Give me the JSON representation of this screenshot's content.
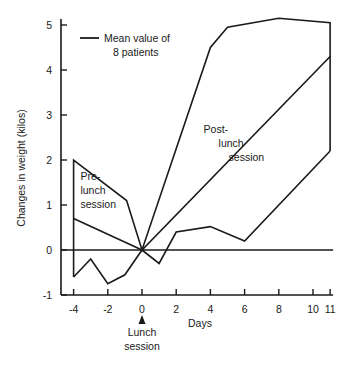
{
  "chart_data": {
    "type": "line",
    "title": "",
    "xlabel": "Days",
    "ylabel": "Changes in weight (kilos)",
    "xlim": [
      -4,
      11
    ],
    "ylim": [
      -1,
      5
    ],
    "x_ticks": [
      -4,
      -2,
      0,
      2,
      4,
      6,
      8,
      10,
      11
    ],
    "x_tick_labels": [
      "-4",
      "-2",
      "0",
      "2",
      "4",
      "6",
      "8",
      "10",
      "11"
    ],
    "y_ticks": [
      -1,
      0,
      1,
      2,
      3,
      4,
      5
    ],
    "y_tick_labels": [
      "-1",
      "0",
      "1",
      "2",
      "3",
      "4",
      "5"
    ],
    "grid": false,
    "zero_line": true,
    "legend": {
      "placement": "top-left",
      "entries": [
        "Mean value of",
        "8 patients"
      ]
    },
    "series": [
      {
        "name": "upper-envelope",
        "points": [
          [
            -4,
            -0.6
          ],
          [
            -4,
            2.0
          ],
          [
            -0.9,
            1.1
          ],
          [
            0,
            0
          ],
          [
            4,
            4.5
          ],
          [
            5,
            4.95
          ],
          [
            8,
            5.15
          ],
          [
            11,
            5.05
          ],
          [
            11,
            2.2
          ]
        ]
      },
      {
        "name": "mean",
        "points": [
          [
            -4,
            0.7
          ],
          [
            0,
            0
          ],
          [
            11,
            4.3
          ]
        ]
      },
      {
        "name": "lower-envelope",
        "points": [
          [
            -4,
            -0.6
          ],
          [
            -3,
            -0.2
          ],
          [
            -2,
            -0.75
          ],
          [
            -1,
            -0.55
          ],
          [
            0,
            0
          ],
          [
            1,
            -0.3
          ],
          [
            2,
            0.4
          ],
          [
            4,
            0.52
          ],
          [
            6,
            0.2
          ],
          [
            11,
            2.2
          ]
        ]
      }
    ],
    "annotations": [
      {
        "id": "pre",
        "lines": [
          "Pre-",
          "lunch",
          "session"
        ],
        "x": -3.6,
        "y": 1.55
      },
      {
        "id": "post",
        "lines": [
          "Post-",
          "lunch",
          "session"
        ],
        "x": 3.6,
        "y": 2.6
      },
      {
        "id": "lunch",
        "lines": [
          "Lunch",
          "session"
        ],
        "x": 0,
        "y": -1.9,
        "arrow_to_x": 0
      }
    ]
  }
}
